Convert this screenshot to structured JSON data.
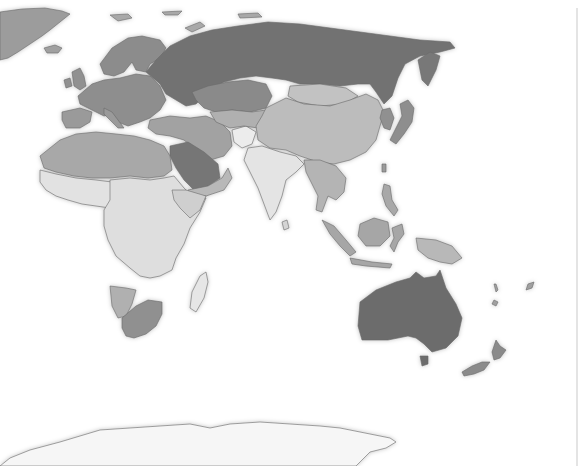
{
  "map": {
    "style": "grayscale choropleth world map (Eastern Hemisphere)",
    "palette": {
      "background": "#ffffff",
      "darkest": "#6e6e6e",
      "dark": "#8a8a8a",
      "medium": "#a6a6a6",
      "light": "#c4c4c4",
      "lightest": "#e2e2e2",
      "border": "#6a6a6a"
    },
    "regions": [
      {
        "name": "Greenland",
        "shade": "medium"
      },
      {
        "name": "Iceland",
        "shade": "medium"
      },
      {
        "name": "Scandinavia",
        "shade": "dark"
      },
      {
        "name": "Western Europe",
        "shade": "dark"
      },
      {
        "name": "Russia",
        "shade": "darkest"
      },
      {
        "name": "Kazakhstan",
        "shade": "dark"
      },
      {
        "name": "China",
        "shade": "light"
      },
      {
        "name": "Mongolia",
        "shade": "light"
      },
      {
        "name": "Japan",
        "shade": "dark"
      },
      {
        "name": "Korea",
        "shade": "dark"
      },
      {
        "name": "India",
        "shade": "lightest"
      },
      {
        "name": "Middle East",
        "shade": "medium"
      },
      {
        "name": "Saudi Arabia",
        "shade": "darkest"
      },
      {
        "name": "Afghanistan",
        "shade": "lightest"
      },
      {
        "name": "North Africa",
        "shade": "medium"
      },
      {
        "name": "Central Africa",
        "shade": "lightest"
      },
      {
        "name": "Southern Africa",
        "shade": "medium"
      },
      {
        "name": "South Africa",
        "shade": "dark"
      },
      {
        "name": "Madagascar",
        "shade": "lightest"
      },
      {
        "name": "Southeast Asia",
        "shade": "light"
      },
      {
        "name": "Indonesia",
        "shade": "medium"
      },
      {
        "name": "Papua New Guinea",
        "shade": "light"
      },
      {
        "name": "Australia",
        "shade": "darkest"
      },
      {
        "name": "New Zealand",
        "shade": "dark"
      },
      {
        "name": "Antarctica",
        "shade": "lightest"
      }
    ]
  }
}
